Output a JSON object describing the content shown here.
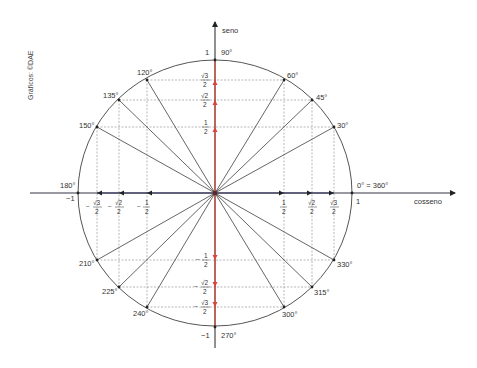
{
  "credit": "Gráficos: ©DAE",
  "axes": {
    "y_label": "seno",
    "x_label": "cosseno",
    "y_top_value": "1",
    "y_bottom_value": "−1",
    "x_right_value": "1",
    "x_left_value": "−1"
  },
  "angle_labels": {
    "a0": "0° = 360°",
    "a30": "30°",
    "a45": "45°",
    "a60": "60°",
    "a90": "90°",
    "a120": "120°",
    "a135": "135°",
    "a150": "150°",
    "a180": "180°",
    "a210": "210°",
    "a225": "225°",
    "a240": "240°",
    "a270": "270°",
    "a300": "300°",
    "a315": "315°",
    "a330": "330°"
  },
  "fractions": {
    "half_num": "1",
    "den": "2",
    "sqrt2_num": "√2",
    "sqrt3_num": "√3",
    "minus": "−"
  },
  "colors": {
    "circle": "#555555",
    "axis": "#333344",
    "sine_axis": "#d9453a",
    "dashed": "#888888",
    "radius": "#555555"
  }
}
